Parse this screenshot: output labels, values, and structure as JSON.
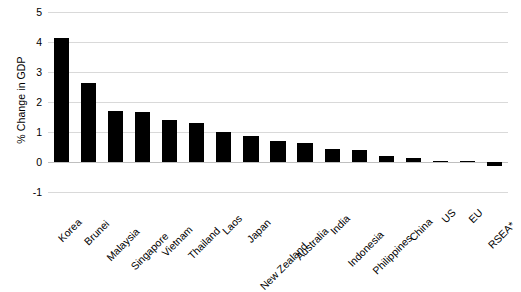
{
  "chart_data": {
    "type": "bar",
    "title": "",
    "xlabel": "",
    "ylabel": "% Change in GDP",
    "categories": [
      "Korea",
      "Brunei",
      "Malaysia",
      "Singapore",
      "Vietnam",
      "Thailand",
      "Laos",
      "Japan",
      "New Zealand",
      "Australia",
      "India",
      "Indonesia",
      "Philippines",
      "China",
      "US",
      "EU",
      "RSEA*"
    ],
    "values": [
      4.15,
      2.62,
      1.7,
      1.66,
      1.41,
      1.29,
      1.0,
      0.88,
      0.7,
      0.62,
      0.42,
      0.4,
      0.21,
      0.15,
      0.05,
      0.04,
      -0.12
    ],
    "ylim": [
      -1,
      5
    ],
    "yticks": [
      -1,
      0,
      1,
      2,
      3,
      4,
      5
    ],
    "ytick_labels": [
      "-1",
      "0",
      "1",
      "2",
      "3",
      "4",
      "5"
    ],
    "grid": true,
    "legend": false,
    "bar_color": "#000000",
    "gridline_color": "#d9d9d9"
  }
}
